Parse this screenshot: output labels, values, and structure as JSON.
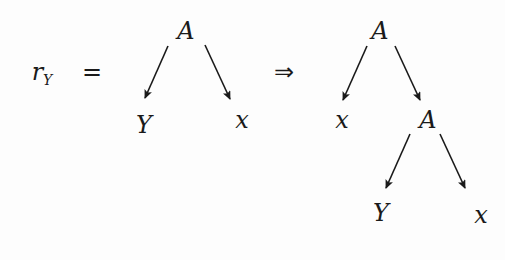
{
  "equation": {
    "lhs_symbol": "r",
    "lhs_subscript": "Y",
    "equals": "=",
    "implies": "⇒"
  },
  "left_tree": {
    "root": "A",
    "children": [
      "Y",
      "x"
    ]
  },
  "right_tree": {
    "root": "A",
    "children": [
      "x",
      "A"
    ],
    "subtree": {
      "root": "A",
      "children": [
        "Y",
        "x"
      ]
    }
  },
  "colors": {
    "ink": "#1a1a1a",
    "background": "#fdfdfd"
  }
}
